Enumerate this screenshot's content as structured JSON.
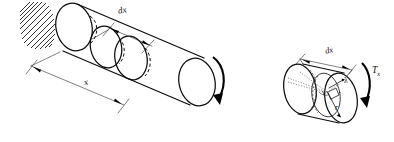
{
  "figure": {
    "background_color": "#ffffff",
    "line_color": "#0d0d0d",
    "width": 394,
    "height": 142
  },
  "left_figure": {
    "name": "fixed-end-shaft",
    "support": {
      "type": "fixed-wall-hatching",
      "label": "",
      "hatch_count": 14
    },
    "labels": {
      "element_width": "dx",
      "distance": "x"
    },
    "torque_arrow": {
      "icon": "curved-arrow-clockwise",
      "label": ""
    },
    "cross_sections": 3
  },
  "right_figure": {
    "name": "shaft-element-detail",
    "labels": {
      "element_width": "dx",
      "torque": "T",
      "torque_subscript": "x",
      "twist_angle": "λ",
      "shear_strain": "γ",
      "radius": "r"
    },
    "torque_arrow": {
      "icon": "curved-arrow-clockwise"
    }
  }
}
